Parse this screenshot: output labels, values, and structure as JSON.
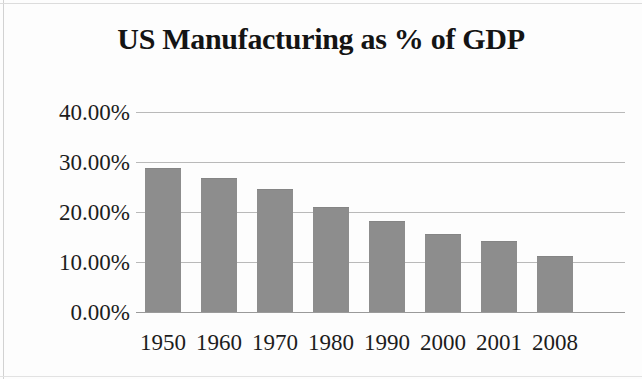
{
  "chart_data": {
    "type": "bar",
    "title": "US Manufacturing as % of GDP",
    "xlabel": "",
    "ylabel": "",
    "categories": [
      "1950",
      "1960",
      "1970",
      "1980",
      "1990",
      "2000",
      "2001",
      "2008"
    ],
    "values": [
      28.8,
      26.8,
      24.6,
      21.0,
      18.2,
      15.6,
      14.2,
      11.2
    ],
    "value_labels": [
      "28.80%",
      "26.80%",
      "24.60%",
      "21.00%",
      "18.20%",
      "15.60%",
      "14.20%",
      "11.20%"
    ],
    "ylim": [
      0,
      40
    ],
    "ytick_labels": [
      "0.00%",
      "10.00%",
      "20.00%",
      "30.00%",
      "40.00%"
    ],
    "ytick_values": [
      0,
      10,
      20,
      30,
      40
    ],
    "grid": true,
    "legend": "none",
    "series_color": "#8d8d8d",
    "gridline_color": "#b9b9b9",
    "text_color": "#1c1c1c",
    "background_color": "#fdfdfd"
  }
}
